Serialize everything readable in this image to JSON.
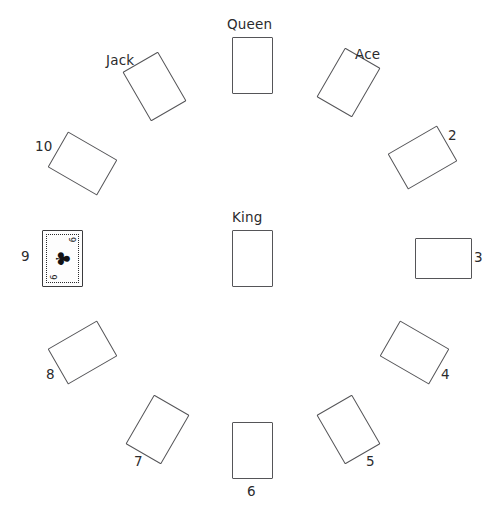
{
  "canvas": {
    "width": 502,
    "height": 513,
    "background": "#ffffff",
    "card_border_color": "#555558",
    "label_color": "#2b2b2d",
    "selected_border_color": "#3b3b3d"
  },
  "cards": [
    {
      "id": "queen",
      "label": "Queen",
      "rank": "Queen",
      "rotation_deg": 0,
      "center_x": 252,
      "center_y": 65,
      "orientation": "portrait",
      "label_x": 227,
      "label_y": 18,
      "selected": false
    },
    {
      "id": "ace",
      "label": "Ace",
      "rank": "Ace",
      "rotation_deg": 30,
      "center_x": 348,
      "center_y": 82,
      "orientation": "portrait",
      "label_x": 355,
      "label_y": 48,
      "selected": false
    },
    {
      "id": "two",
      "label": "2",
      "rank": "2",
      "rotation_deg": 60,
      "center_x": 422,
      "center_y": 157,
      "orientation": "portrait",
      "label_x": 448,
      "label_y": 129,
      "selected": false
    },
    {
      "id": "three",
      "label": "3",
      "rank": "3",
      "rotation_deg": 90,
      "center_x": 443,
      "center_y": 258,
      "orientation": "landscape",
      "label_x": 474,
      "label_y": 251,
      "selected": false
    },
    {
      "id": "four",
      "label": "4",
      "rank": "4",
      "rotation_deg": 120,
      "center_x": 414,
      "center_y": 352,
      "orientation": "portrait",
      "label_x": 441,
      "label_y": 368,
      "selected": false
    },
    {
      "id": "five",
      "label": "5",
      "rank": "5",
      "rotation_deg": 150,
      "center_x": 348,
      "center_y": 429,
      "orientation": "portrait",
      "label_x": 366,
      "label_y": 455,
      "selected": false
    },
    {
      "id": "six",
      "label": "6",
      "rank": "6",
      "rotation_deg": 180,
      "center_x": 252,
      "center_y": 450,
      "orientation": "portrait",
      "label_x": 247,
      "label_y": 485,
      "selected": false
    },
    {
      "id": "seven",
      "label": "7",
      "rank": "7",
      "rotation_deg": 210,
      "center_x": 157,
      "center_y": 429,
      "orientation": "portrait",
      "label_x": 134,
      "label_y": 455,
      "selected": false
    },
    {
      "id": "eight",
      "label": "8",
      "rank": "8",
      "rotation_deg": 240,
      "center_x": 82,
      "center_y": 352,
      "orientation": "portrait",
      "label_x": 46,
      "label_y": 368,
      "selected": false
    },
    {
      "id": "nine",
      "label": "9",
      "rank": "9",
      "rotation_deg": 180,
      "center_x": 62,
      "center_y": 258,
      "orientation": "landscape",
      "label_x": 21,
      "label_y": 250,
      "selected": true,
      "suit_symbol": "♣",
      "corner_rank_top": "9",
      "corner_rank_bottom": "9"
    },
    {
      "id": "ten",
      "label": "10",
      "rank": "10",
      "rotation_deg": 300,
      "center_x": 82,
      "center_y": 163,
      "orientation": "portrait",
      "label_x": 35,
      "label_y": 140,
      "selected": false
    },
    {
      "id": "jack",
      "label": "Jack",
      "rank": "Jack",
      "rotation_deg": 330,
      "center_x": 154,
      "center_y": 86,
      "orientation": "portrait",
      "label_x": 106,
      "label_y": 54,
      "selected": false
    },
    {
      "id": "king",
      "label": "King",
      "rank": "King",
      "rotation_deg": 0,
      "center_x": 252,
      "center_y": 258,
      "orientation": "portrait",
      "label_x": 232,
      "label_y": 211,
      "selected": false
    }
  ]
}
